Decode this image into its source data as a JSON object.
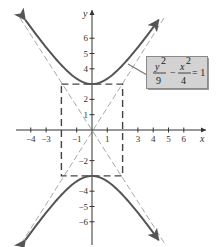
{
  "chart_data": {
    "type": "line",
    "title": "",
    "equation": {
      "lhs_num1": "y",
      "lhs_den1": "9",
      "minus": "−",
      "lhs_num2": "x",
      "lhs_den2": "4",
      "exp": "2",
      "rhs": "= 1"
    },
    "xlabel": "x",
    "ylabel": "y",
    "xlim": [
      -4.5,
      7.3
    ],
    "ylim": [
      -7.3,
      7.8
    ],
    "x_ticks": [
      -4,
      -3,
      -1,
      1,
      3,
      4,
      5,
      6
    ],
    "x_tick_labels": [
      "−4",
      "−3",
      "−1",
      "1",
      "3",
      "4",
      "5",
      "6"
    ],
    "y_ticks": [
      6,
      5,
      4,
      2,
      1,
      -2,
      -4,
      -5,
      -6
    ],
    "y_tick_labels": [
      "6",
      "5",
      "4",
      "2",
      "1",
      "−2",
      "−4",
      "−5",
      "−6"
    ],
    "grid": false,
    "series": [
      {
        "name": "hyperbola upper branch",
        "style": "solid",
        "color": "#555555",
        "function": "y = 3*sqrt(1 + x^2/4)",
        "x_range": [
          -4.36,
          4.36
        ]
      },
      {
        "name": "hyperbola lower branch",
        "style": "solid",
        "color": "#555555",
        "function": "y = -3*sqrt(1 + x^2/4)",
        "x_range": [
          -4.36,
          4.36
        ]
      },
      {
        "name": "asymptote y = 1.5x",
        "style": "dashed",
        "color": "#999999"
      },
      {
        "name": "asymptote y = -1.5x",
        "style": "dashed",
        "color": "#999999"
      },
      {
        "name": "central rectangle",
        "style": "dashed",
        "color": "#444444",
        "x": [
          -2,
          2
        ],
        "y": [
          -3,
          3
        ]
      }
    ],
    "annotation": {
      "text": "y²/9 − x²/4 = 1",
      "box_fill": "#d3d3d3",
      "box_border": "#8a8a8a"
    }
  },
  "colors": {
    "axis": "#333333",
    "curve": "#555555",
    "asymptote": "#a0a0a0",
    "rectangle": "#444444",
    "label_box": "#d3d3d3",
    "label_border": "#8a8a8a"
  }
}
